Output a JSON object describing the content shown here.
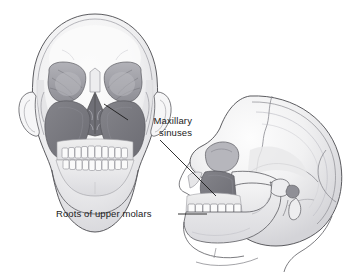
{
  "figure": {
    "background_color": "#ffffff",
    "width": 361,
    "height": 276
  },
  "labels": {
    "maxillary_sinuses": {
      "line1": "Maxillary",
      "line2": "sinuses"
    },
    "roots_of_upper_molars": "Roots of upper molars"
  },
  "illustration": {
    "views": [
      {
        "name": "anterior-skull",
        "description": "Frontal view of human skull"
      },
      {
        "name": "lateral-skull",
        "description": "Right lateral view of human skull"
      }
    ],
    "colors": {
      "bone_light": "#f4f4f5",
      "bone_mid": "#e2e2e4",
      "bone_shadow": "#c9c9cd",
      "outline": "#4a4a4e",
      "orbit_gray": "#a3a3a9",
      "sinus_dark": "#76767c",
      "sinus_darker": "#6a6a70",
      "leader_line": "#1b1b1b"
    }
  }
}
